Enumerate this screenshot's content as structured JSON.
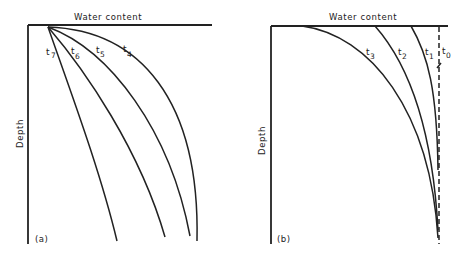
{
  "figure": {
    "panels": [
      {
        "id": "a",
        "panel_label": "(a)",
        "x_axis_label": "Water content",
        "y_axis_label": "Depth",
        "curves": [
          {
            "label": "t",
            "sub": "7"
          },
          {
            "label": "t",
            "sub": "6"
          },
          {
            "label": "t",
            "sub": "5"
          },
          {
            "label": "t",
            "sub": "4"
          }
        ]
      },
      {
        "id": "b",
        "panel_label": "(b)",
        "x_axis_label": "Water content",
        "y_axis_label": "Depth",
        "curves": [
          {
            "label": "t",
            "sub": "3"
          },
          {
            "label": "t",
            "sub": "2"
          },
          {
            "label": "t",
            "sub": "1"
          },
          {
            "label": "t",
            "sub": "0",
            "style": "dashed"
          }
        ]
      }
    ],
    "colors": {
      "ink": "#222222",
      "background": "#ffffff"
    }
  }
}
